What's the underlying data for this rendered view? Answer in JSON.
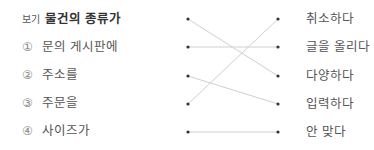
{
  "example_tag": "보기",
  "left_items": [
    {
      "num": "",
      "label": "물건의 종류가",
      "is_example": true
    },
    {
      "num": "①",
      "label": "문의 게시판에"
    },
    {
      "num": "②",
      "label": "주소를"
    },
    {
      "num": "③",
      "label": "주문을"
    },
    {
      "num": "④",
      "label": "사이즈가"
    }
  ],
  "right_items": [
    {
      "label": "취소하다"
    },
    {
      "label": "글을 올리다"
    },
    {
      "label": "다양하다"
    },
    {
      "label": "입력하다"
    },
    {
      "label": "안 맞다"
    }
  ],
  "connections": [
    {
      "from": 0,
      "to": 2
    },
    {
      "from": 1,
      "to": 1
    },
    {
      "from": 2,
      "to": 3
    },
    {
      "from": 3,
      "to": 0
    },
    {
      "from": 4,
      "to": 4
    }
  ],
  "colors": {
    "dot": "#333333",
    "line": "#cfcfcf"
  }
}
